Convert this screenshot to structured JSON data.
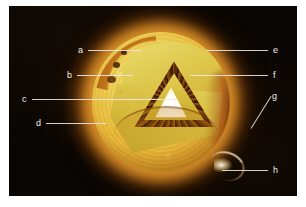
{
  "figure": {
    "background_color": "#ffffff",
    "plate_color": "#080502",
    "watermark_text": "Science Photo"
  },
  "sun": {
    "core_color": "#ffffff",
    "photosphere_color": "#e8bc3c",
    "convective_color": "#a65a10",
    "corona_color": "#f0a326",
    "space_color": "#080502"
  },
  "labels": [
    {
      "id": "a",
      "text": "a",
      "side": "left",
      "x": 78,
      "y": 46,
      "line_from": 88,
      "line_to": 141,
      "line_y": 50
    },
    {
      "id": "b",
      "text": "b",
      "side": "left",
      "x": 67,
      "y": 71,
      "line_from": 77,
      "line_to": 133,
      "line_y": 75
    },
    {
      "id": "c",
      "text": "c",
      "side": "left",
      "x": 22,
      "y": 95,
      "line_from": 32,
      "line_to": 176,
      "line_y": 99
    },
    {
      "id": "d",
      "text": "d",
      "side": "left",
      "x": 36,
      "y": 119,
      "line_from": 46,
      "line_to": 106,
      "line_y": 123
    },
    {
      "id": "e",
      "text": "e",
      "side": "right",
      "x": 273,
      "y": 46,
      "line_from": 206,
      "line_to": 268,
      "line_y": 50
    },
    {
      "id": "f",
      "text": "f",
      "side": "right",
      "x": 273,
      "y": 71,
      "line_from": 190,
      "line_to": 268,
      "line_y": 75
    },
    {
      "id": "g",
      "text": "g",
      "side": "right",
      "x": 272,
      "y": 92,
      "diagonal": true
    },
    {
      "id": "h",
      "text": "h",
      "side": "right",
      "x": 273,
      "y": 166,
      "line_from": 222,
      "line_to": 268,
      "line_y": 170
    }
  ]
}
